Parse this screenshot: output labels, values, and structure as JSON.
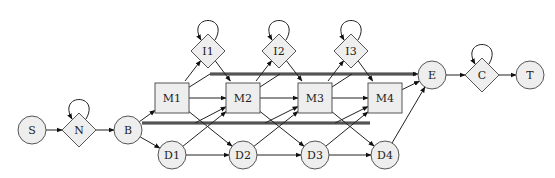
{
  "diagram": {
    "type": "profile-HMM state diagram",
    "nodes": [
      {
        "id": "S",
        "label": "S",
        "shape": "circle",
        "x": 32,
        "y": 130
      },
      {
        "id": "N",
        "label": "N",
        "shape": "diamond",
        "x": 79,
        "y": 130,
        "self_loop": true
      },
      {
        "id": "B",
        "label": "B",
        "shape": "circle",
        "x": 128,
        "y": 130
      },
      {
        "id": "M1",
        "label": "M1",
        "shape": "square",
        "x": 172,
        "y": 98
      },
      {
        "id": "M2",
        "label": "M2",
        "shape": "square",
        "x": 243,
        "y": 98
      },
      {
        "id": "M3",
        "label": "M3",
        "shape": "square",
        "x": 315,
        "y": 98
      },
      {
        "id": "M4",
        "label": "M4",
        "shape": "square",
        "x": 385,
        "y": 98
      },
      {
        "id": "I1",
        "label": "I1",
        "shape": "diamond",
        "x": 208,
        "y": 51,
        "self_loop": true
      },
      {
        "id": "I2",
        "label": "I2",
        "shape": "diamond",
        "x": 279,
        "y": 51,
        "self_loop": true
      },
      {
        "id": "I3",
        "label": "I3",
        "shape": "diamond",
        "x": 351,
        "y": 51,
        "self_loop": true
      },
      {
        "id": "D1",
        "label": "D1",
        "shape": "circle",
        "x": 172,
        "y": 155
      },
      {
        "id": "D2",
        "label": "D2",
        "shape": "circle",
        "x": 243,
        "y": 155
      },
      {
        "id": "D3",
        "label": "D3",
        "shape": "circle",
        "x": 315,
        "y": 155
      },
      {
        "id": "D4",
        "label": "D4",
        "shape": "circle",
        "x": 385,
        "y": 155
      },
      {
        "id": "E",
        "label": "E",
        "shape": "circle",
        "x": 432,
        "y": 75
      },
      {
        "id": "C",
        "label": "C",
        "shape": "diamond",
        "x": 482,
        "y": 75,
        "self_loop": true
      },
      {
        "id": "T",
        "label": "T",
        "shape": "circle",
        "x": 530,
        "y": 75
      }
    ],
    "edges": [
      [
        "S",
        "N"
      ],
      [
        "N",
        "B"
      ],
      [
        "B",
        "M1"
      ],
      [
        "B",
        "D1"
      ],
      [
        "B",
        "M2"
      ],
      [
        "B",
        "M3"
      ],
      [
        "B",
        "M4"
      ],
      [
        "M1",
        "I1"
      ],
      [
        "M1",
        "M2"
      ],
      [
        "M1",
        "D2"
      ],
      [
        "I1",
        "M2"
      ],
      [
        "D1",
        "M2"
      ],
      [
        "D1",
        "D2"
      ],
      [
        "M2",
        "I2"
      ],
      [
        "M2",
        "M3"
      ],
      [
        "M2",
        "D3"
      ],
      [
        "I2",
        "M3"
      ],
      [
        "D2",
        "M3"
      ],
      [
        "D2",
        "D3"
      ],
      [
        "M3",
        "I3"
      ],
      [
        "M3",
        "M4"
      ],
      [
        "M3",
        "D4"
      ],
      [
        "I3",
        "M4"
      ],
      [
        "D3",
        "M4"
      ],
      [
        "D3",
        "D4"
      ],
      [
        "M1",
        "E"
      ],
      [
        "M2",
        "E"
      ],
      [
        "M3",
        "E"
      ],
      [
        "M4",
        "E"
      ],
      [
        "D4",
        "E"
      ],
      [
        "E",
        "C"
      ],
      [
        "C",
        "T"
      ]
    ],
    "colors": {
      "node_fill": "#eeeeee",
      "node_stroke": "#555555",
      "edge": "#222222",
      "background": "#ffffff"
    }
  }
}
